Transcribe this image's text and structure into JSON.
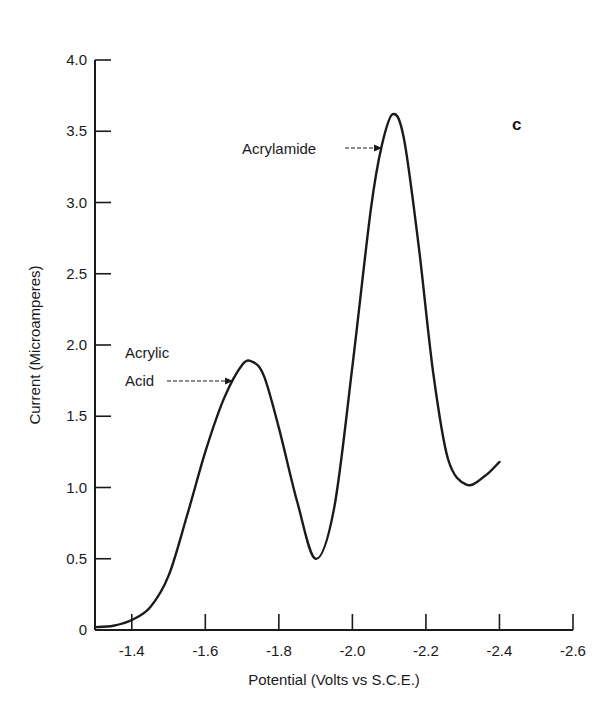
{
  "chart_data": {
    "type": "line",
    "title": "",
    "panel_label": "c",
    "xlabel": "Potential (Volts vs S.C.E.)",
    "ylabel": "Current (Microamperes)",
    "xlim": [
      -1.3,
      -2.6
    ],
    "ylim": [
      0,
      4.0
    ],
    "x_ticks": [
      -1.4,
      -1.6,
      -1.8,
      -2.0,
      -2.2,
      -2.4,
      -2.6
    ],
    "x_tick_labels": [
      "-1.4",
      "-1.6",
      "-1.8",
      "-2.0",
      "-2.2",
      "-2.4",
      "-2.6"
    ],
    "y_ticks": [
      0,
      0.5,
      1.0,
      1.5,
      2.0,
      2.5,
      3.0,
      3.5,
      4.0
    ],
    "y_tick_labels": [
      "0",
      "0.5",
      "1.0",
      "1.5",
      "2.0",
      "2.5",
      "3.0",
      "3.5",
      "4.0"
    ],
    "grid": false,
    "legend": null,
    "series": [
      {
        "name": "Polarogram",
        "x": [
          -1.3,
          -1.35,
          -1.4,
          -1.45,
          -1.5,
          -1.55,
          -1.6,
          -1.65,
          -1.7,
          -1.73,
          -1.76,
          -1.8,
          -1.85,
          -1.9,
          -1.95,
          -2.0,
          -2.05,
          -2.08,
          -2.11,
          -2.14,
          -2.18,
          -2.22,
          -2.26,
          -2.31,
          -2.36,
          -2.4
        ],
        "y": [
          0.02,
          0.03,
          0.07,
          0.16,
          0.38,
          0.8,
          1.25,
          1.62,
          1.86,
          1.88,
          1.78,
          1.42,
          0.9,
          0.5,
          0.85,
          1.85,
          2.95,
          3.4,
          3.62,
          3.45,
          2.7,
          1.8,
          1.2,
          1.02,
          1.08,
          1.18
        ]
      }
    ],
    "annotations": [
      {
        "text": [
          "Acrylic",
          "Acid"
        ],
        "points_to": {
          "x": -1.68,
          "y": 1.68
        },
        "arrow_style": "dashed"
      },
      {
        "text": [
          "Acrylamide"
        ],
        "points_to": {
          "x": -2.07,
          "y": 3.2
        },
        "arrow_style": "dashed"
      }
    ]
  },
  "colors": {
    "line": "#1a1a1a",
    "axis": "#1a1a1a",
    "background": "#ffffff"
  }
}
